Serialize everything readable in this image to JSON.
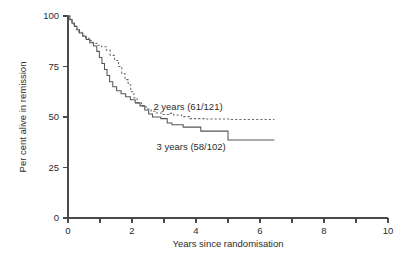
{
  "chart_data": {
    "type": "line",
    "title": "",
    "subtitle": "",
    "xlabel": "Years since randomisation",
    "ylabel": "Per cent alive in remission",
    "xlim": [
      0,
      10
    ],
    "ylim": [
      0,
      100
    ],
    "grid": false,
    "legend_position": "inline-annotation",
    "x_ticks": [
      0,
      1,
      2,
      3,
      4,
      5,
      6,
      7,
      8,
      9,
      10
    ],
    "x_tick_labels": [
      "0",
      "",
      "2",
      "",
      "4",
      "",
      "6",
      "",
      "8",
      "",
      "10"
    ],
    "y_ticks": [
      0,
      25,
      50,
      75,
      100
    ],
    "y_tick_labels": [
      "0",
      "25",
      "50",
      "75",
      "100"
    ],
    "annotations": [
      {
        "text": "2 years (61/121)",
        "x": 3.75,
        "y": 53.5
      },
      {
        "text": "3 years (58/102)",
        "x": 3.85,
        "y": 33.5
      }
    ],
    "series": [
      {
        "name": "2 years (61/121)",
        "label": "2 years (61/121)",
        "events": "61/121",
        "style": "dashed",
        "color": "#6a6a6a",
        "points": [
          [
            0.0,
            100.0
          ],
          [
            0.06,
            100.0
          ],
          [
            0.06,
            98.3
          ],
          [
            0.12,
            98.3
          ],
          [
            0.12,
            96.7
          ],
          [
            0.18,
            96.7
          ],
          [
            0.18,
            95.0
          ],
          [
            0.26,
            95.0
          ],
          [
            0.26,
            93.4
          ],
          [
            0.34,
            93.4
          ],
          [
            0.34,
            92.0
          ],
          [
            0.44,
            92.0
          ],
          [
            0.44,
            90.5
          ],
          [
            0.55,
            90.5
          ],
          [
            0.55,
            89.0
          ],
          [
            0.66,
            89.0
          ],
          [
            0.66,
            87.8
          ],
          [
            0.78,
            87.8
          ],
          [
            0.78,
            86.5
          ],
          [
            0.9,
            86.5
          ],
          [
            0.9,
            85.5
          ],
          [
            1.05,
            85.5
          ],
          [
            1.05,
            84.8
          ],
          [
            1.2,
            84.8
          ],
          [
            1.2,
            83.0
          ],
          [
            1.32,
            83.0
          ],
          [
            1.32,
            80.5
          ],
          [
            1.45,
            80.5
          ],
          [
            1.45,
            78.0
          ],
          [
            1.58,
            78.0
          ],
          [
            1.58,
            75.0
          ],
          [
            1.68,
            75.0
          ],
          [
            1.68,
            71.5
          ],
          [
            1.78,
            71.5
          ],
          [
            1.78,
            68.5
          ],
          [
            1.88,
            68.5
          ],
          [
            1.88,
            66.0
          ],
          [
            1.96,
            66.0
          ],
          [
            1.96,
            62.5
          ],
          [
            2.06,
            62.5
          ],
          [
            2.06,
            59.5
          ],
          [
            2.16,
            59.5
          ],
          [
            2.16,
            57.0
          ],
          [
            2.3,
            57.0
          ],
          [
            2.3,
            55.5
          ],
          [
            2.44,
            55.5
          ],
          [
            2.44,
            54.0
          ],
          [
            2.6,
            54.0
          ],
          [
            2.6,
            52.8
          ],
          [
            2.76,
            52.8
          ],
          [
            2.76,
            52.0
          ],
          [
            2.95,
            52.0
          ],
          [
            2.95,
            51.2
          ],
          [
            3.15,
            51.2
          ],
          [
            3.15,
            51.8
          ],
          [
            3.3,
            51.8
          ],
          [
            3.3,
            51.0
          ],
          [
            3.55,
            51.0
          ],
          [
            3.55,
            50.2
          ],
          [
            3.8,
            50.2
          ],
          [
            3.8,
            49.2
          ],
          [
            4.3,
            49.2
          ],
          [
            4.3,
            49.0
          ],
          [
            5.1,
            49.0
          ],
          [
            5.1,
            48.8
          ],
          [
            6.45,
            48.8
          ]
        ]
      },
      {
        "name": "3 years (58/102)",
        "label": "3 years (58/102)",
        "events": "58/102",
        "style": "solid",
        "color": "#555555",
        "points": [
          [
            0.0,
            100.0
          ],
          [
            0.06,
            100.0
          ],
          [
            0.06,
            98.2
          ],
          [
            0.13,
            98.2
          ],
          [
            0.13,
            96.4
          ],
          [
            0.2,
            96.4
          ],
          [
            0.2,
            94.8
          ],
          [
            0.28,
            94.8
          ],
          [
            0.28,
            93.2
          ],
          [
            0.36,
            93.2
          ],
          [
            0.36,
            91.6
          ],
          [
            0.46,
            91.6
          ],
          [
            0.46,
            90.0
          ],
          [
            0.57,
            90.0
          ],
          [
            0.57,
            88.4
          ],
          [
            0.68,
            88.4
          ],
          [
            0.68,
            86.8
          ],
          [
            0.8,
            86.8
          ],
          [
            0.8,
            85.2
          ],
          [
            0.9,
            85.2
          ],
          [
            0.9,
            82.5
          ],
          [
            0.98,
            82.5
          ],
          [
            0.98,
            79.5
          ],
          [
            1.06,
            79.5
          ],
          [
            1.06,
            76.5
          ],
          [
            1.14,
            76.5
          ],
          [
            1.14,
            73.5
          ],
          [
            1.22,
            73.5
          ],
          [
            1.22,
            70.5
          ],
          [
            1.3,
            70.5
          ],
          [
            1.3,
            67.5
          ],
          [
            1.4,
            67.5
          ],
          [
            1.4,
            65.0
          ],
          [
            1.52,
            65.0
          ],
          [
            1.52,
            63.0
          ],
          [
            1.66,
            63.0
          ],
          [
            1.66,
            61.5
          ],
          [
            1.8,
            61.5
          ],
          [
            1.8,
            60.0
          ],
          [
            1.95,
            60.0
          ],
          [
            1.95,
            58.5
          ],
          [
            2.1,
            58.5
          ],
          [
            2.1,
            57.0
          ],
          [
            2.25,
            57.0
          ],
          [
            2.25,
            55.5
          ],
          [
            2.4,
            55.5
          ],
          [
            2.4,
            53.5
          ],
          [
            2.52,
            53.5
          ],
          [
            2.52,
            51.5
          ],
          [
            2.64,
            51.5
          ],
          [
            2.64,
            50.0
          ],
          [
            2.9,
            50.0
          ],
          [
            2.9,
            49.2
          ],
          [
            3.1,
            49.2
          ],
          [
            3.1,
            47.0
          ],
          [
            3.25,
            47.0
          ],
          [
            3.25,
            46.2
          ],
          [
            3.6,
            46.2
          ],
          [
            3.6,
            45.0
          ],
          [
            4.15,
            45.0
          ],
          [
            4.15,
            43.0
          ],
          [
            5.0,
            43.0
          ],
          [
            5.0,
            38.6
          ],
          [
            6.45,
            38.6
          ]
        ]
      }
    ]
  }
}
